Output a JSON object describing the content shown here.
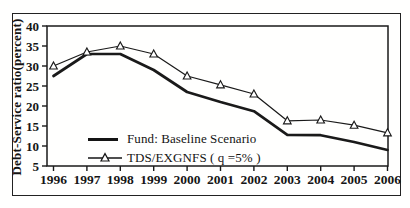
{
  "colors": {
    "ink": "#1a1a1a",
    "background": "#ffffff",
    "marker_fill": "#ffffff"
  },
  "chart_data": {
    "type": "line",
    "title": "",
    "ylabel": "Debt-Service ratio(percent)",
    "ylim": [
      5,
      40
    ],
    "yticks": [
      5,
      10,
      15,
      20,
      25,
      30,
      35,
      40
    ],
    "categories": [
      "1996",
      "1997",
      "1998",
      "1999",
      "2000",
      "2001",
      "2002",
      "2003",
      "2004",
      "2005",
      "2006"
    ],
    "series": [
      {
        "name": "Fund: Baseline Scenario",
        "marker": "none",
        "thick": true,
        "values": [
          27.5,
          33,
          33,
          29,
          23.5,
          21,
          18.7,
          12.8,
          12.7,
          11,
          9
        ]
      },
      {
        "name": "TDS/EXGNFS ( q =5% )",
        "marker": "triangle",
        "thick": false,
        "values": [
          30,
          33.5,
          35,
          33,
          27.5,
          25.3,
          23,
          16.3,
          16.5,
          15.2,
          13.3
        ]
      }
    ],
    "legend_position": "inside-bottom-left",
    "grid": false
  }
}
